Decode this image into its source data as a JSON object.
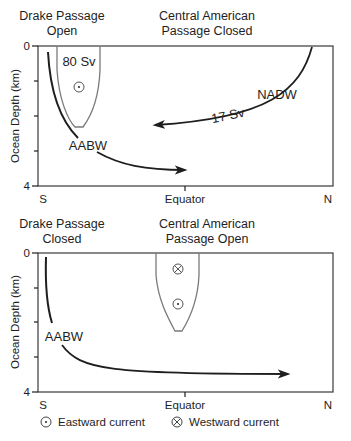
{
  "panels": [
    {
      "id": "top",
      "title_left": [
        "Drake Passage",
        "Open"
      ],
      "title_right": [
        "Central American",
        "Passage Closed"
      ],
      "ylabel": "Ocean Depth (km)",
      "y_ticks": [
        "0",
        "4"
      ],
      "x_labels": [
        "S",
        "Equator",
        "N"
      ],
      "labels": {
        "flow_80": "80 Sv",
        "flow_17": "17 Sv",
        "nadw": "NADW",
        "aabw": "AABW"
      }
    },
    {
      "id": "bottom",
      "title_left": [
        "Drake Passage",
        "Closed"
      ],
      "title_right": [
        "Central American",
        "Passage Open"
      ],
      "ylabel": "Ocean Depth (km)",
      "y_ticks": [
        "0",
        "4"
      ],
      "x_labels": [
        "S",
        "Equator",
        "N"
      ],
      "labels": {
        "aabw": "AABW"
      }
    }
  ],
  "legend": {
    "eastward": "Eastward current",
    "westward": "Westward current"
  },
  "colors": {
    "ink": "#1e1e1e",
    "gray_outline": "#7a7a7a"
  }
}
